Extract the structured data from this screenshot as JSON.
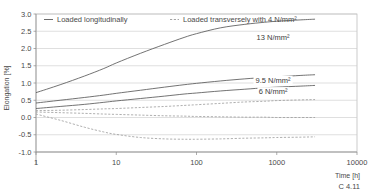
{
  "chart_data": {
    "type": "line",
    "title": "",
    "xlabel": "Time [h]",
    "ylabel": "Elongation [%]",
    "xscale": "log",
    "xlim": [
      1,
      10000
    ],
    "ylim": [
      -1.0,
      3.0
    ],
    "xticks": [
      "1",
      "10",
      "100",
      "1000",
      "10000"
    ],
    "xtick_values": [
      1,
      10,
      100,
      1000,
      10000
    ],
    "yticks": [
      "3.0",
      "2.5",
      "2.0",
      "1.5",
      "1.0",
      "0.5",
      "0.0",
      "-0.5",
      "-1.0"
    ],
    "ytick_values": [
      3.0,
      2.5,
      2.0,
      1.5,
      1.0,
      0.5,
      0.0,
      -0.5,
      -1.0
    ],
    "grid": true,
    "legend_position": "top",
    "legend": [
      {
        "label": "Loaded longitudinally",
        "style": "solid"
      },
      {
        "label": "Loaded transversely with 4 N/mm²",
        "style": "dashed"
      }
    ],
    "series": [
      {
        "name": "13 N/mm²",
        "style": "solid",
        "annotation": "13 N/mm²",
        "points": [
          [
            1,
            0.72
          ],
          [
            2,
            0.95
          ],
          [
            4,
            1.2
          ],
          [
            7,
            1.42
          ],
          [
            10,
            1.58
          ],
          [
            20,
            1.86
          ],
          [
            40,
            2.12
          ],
          [
            70,
            2.32
          ],
          [
            100,
            2.43
          ],
          [
            200,
            2.6
          ],
          [
            400,
            2.7
          ],
          [
            700,
            2.76
          ],
          [
            1000,
            2.79
          ],
          [
            2000,
            2.83
          ],
          [
            3000,
            2.85
          ]
        ]
      },
      {
        "name": "9.5 N/mm²",
        "style": "solid",
        "annotation": "9.5 N/mm²",
        "points": [
          [
            1,
            0.42
          ],
          [
            2,
            0.5
          ],
          [
            4,
            0.58
          ],
          [
            7,
            0.65
          ],
          [
            10,
            0.7
          ],
          [
            20,
            0.79
          ],
          [
            40,
            0.88
          ],
          [
            70,
            0.95
          ],
          [
            100,
            0.99
          ],
          [
            200,
            1.06
          ],
          [
            400,
            1.12
          ],
          [
            700,
            1.16
          ],
          [
            1000,
            1.18
          ],
          [
            2000,
            1.22
          ],
          [
            3000,
            1.24
          ]
        ]
      },
      {
        "name": "6 N/mm²",
        "style": "solid",
        "annotation": "6 N/mm²",
        "points": [
          [
            1,
            0.26
          ],
          [
            2,
            0.32
          ],
          [
            4,
            0.38
          ],
          [
            7,
            0.44
          ],
          [
            10,
            0.48
          ],
          [
            20,
            0.55
          ],
          [
            40,
            0.62
          ],
          [
            70,
            0.68
          ],
          [
            100,
            0.71
          ],
          [
            200,
            0.77
          ],
          [
            400,
            0.82
          ],
          [
            700,
            0.86
          ],
          [
            1000,
            0.88
          ],
          [
            2000,
            0.91
          ],
          [
            3000,
            0.93
          ]
        ]
      },
      {
        "name": "transverse-upper",
        "style": "dashed",
        "annotation": "",
        "points": [
          [
            1,
            0.2
          ],
          [
            2,
            0.21
          ],
          [
            4,
            0.23
          ],
          [
            7,
            0.25
          ],
          [
            10,
            0.26
          ],
          [
            20,
            0.29
          ],
          [
            40,
            0.32
          ],
          [
            70,
            0.35
          ],
          [
            100,
            0.37
          ],
          [
            200,
            0.41
          ],
          [
            400,
            0.45
          ],
          [
            700,
            0.47
          ],
          [
            1000,
            0.49
          ],
          [
            2000,
            0.51
          ],
          [
            3000,
            0.52
          ]
        ]
      },
      {
        "name": "transverse-middle",
        "style": "dashed",
        "annotation": "",
        "points": [
          [
            1,
            0.16
          ],
          [
            2,
            0.14
          ],
          [
            4,
            0.12
          ],
          [
            7,
            0.1
          ],
          [
            10,
            0.09
          ],
          [
            20,
            0.07
          ],
          [
            40,
            0.05
          ],
          [
            70,
            0.04
          ],
          [
            100,
            0.03
          ],
          [
            200,
            0.02
          ],
          [
            400,
            0.01
          ],
          [
            700,
            0.01
          ],
          [
            1000,
            0.0
          ],
          [
            2000,
            0.0
          ],
          [
            3000,
            0.0
          ]
        ]
      },
      {
        "name": "transverse-lower",
        "style": "dashed",
        "annotation": "",
        "points": [
          [
            1,
            0.1
          ],
          [
            2,
            -0.08
          ],
          [
            4,
            -0.28
          ],
          [
            7,
            -0.42
          ],
          [
            10,
            -0.49
          ],
          [
            20,
            -0.58
          ],
          [
            40,
            -0.62
          ],
          [
            70,
            -0.63
          ],
          [
            100,
            -0.63
          ],
          [
            200,
            -0.62
          ],
          [
            400,
            -0.6
          ],
          [
            700,
            -0.59
          ],
          [
            1000,
            -0.58
          ],
          [
            2000,
            -0.57
          ],
          [
            3000,
            -0.56
          ]
        ]
      }
    ],
    "annotations": [
      {
        "text": "13 N/mm²",
        "x": 900,
        "y": 2.3
      },
      {
        "text": "9.5 N/mm²",
        "x": 900,
        "y": 1.05
      },
      {
        "text": "6 N/mm²",
        "x": 900,
        "y": 0.72
      }
    ],
    "caption": "C 4.11"
  },
  "colors": {
    "solid": "#5a5a5a",
    "dashed": "#9a9a9a",
    "grid": "#c9c9c9",
    "axis": "#8a8a8a",
    "text": "#4a4a4a",
    "background": "#ffffff"
  }
}
